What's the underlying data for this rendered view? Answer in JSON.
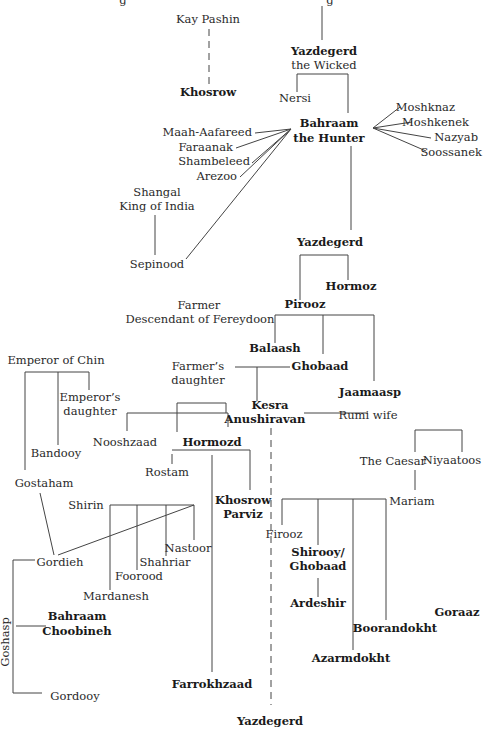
{
  "diagram": {
    "type": "genealogy-tree",
    "nodes": [
      {
        "id": "cut-g1",
        "text": "g",
        "x": 123,
        "y": 4,
        "anchor": "middle",
        "bold": false
      },
      {
        "id": "cut-g2",
        "text": "g",
        "x": 330,
        "y": 4,
        "anchor": "middle",
        "bold": false
      },
      {
        "id": "kay-pashin",
        "text": "Kay Pashin",
        "x": 208,
        "y": 23,
        "anchor": "middle",
        "bold": false
      },
      {
        "id": "khosrow",
        "text": "Khosrow",
        "x": 208,
        "y": 96,
        "anchor": "middle",
        "bold": true
      },
      {
        "id": "yazdegerd-wicked",
        "text": "Yazdegerd",
        "x": 324,
        "y": 55,
        "anchor": "middle",
        "bold": true
      },
      {
        "id": "yazdegerd-wicked-epithet",
        "text": "the Wicked",
        "x": 324,
        "y": 69,
        "anchor": "middle",
        "bold": false
      },
      {
        "id": "nersi",
        "text": "Nersi",
        "x": 295,
        "y": 102,
        "anchor": "middle",
        "bold": false
      },
      {
        "id": "bahraam-hunter",
        "text": "Bahraam",
        "x": 329,
        "y": 127,
        "anchor": "middle",
        "bold": true
      },
      {
        "id": "bahraam-hunter-epithet",
        "text": "the Hunter",
        "x": 329,
        "y": 142,
        "anchor": "middle",
        "bold": true
      },
      {
        "id": "moshknaz",
        "text": "Moshknaz",
        "x": 455,
        "y": 111,
        "anchor": "end",
        "bold": false
      },
      {
        "id": "moshkenek",
        "text": "Moshkenek",
        "x": 469,
        "y": 126,
        "anchor": "end",
        "bold": false
      },
      {
        "id": "nazyab",
        "text": "Nazyab",
        "x": 478,
        "y": 141,
        "anchor": "end",
        "bold": false
      },
      {
        "id": "soossanek",
        "text": "Soossanek",
        "x": 482,
        "y": 156,
        "anchor": "end",
        "bold": false
      },
      {
        "id": "maah-aafareed",
        "text": "Maah-Aafareed",
        "x": 252,
        "y": 136,
        "anchor": "end",
        "bold": false
      },
      {
        "id": "faraanak",
        "text": "Faraanak",
        "x": 233,
        "y": 151,
        "anchor": "end",
        "bold": false
      },
      {
        "id": "shambeleed",
        "text": "Shambeleed",
        "x": 250,
        "y": 165,
        "anchor": "end",
        "bold": false
      },
      {
        "id": "arezoo",
        "text": "Arezoo",
        "x": 237,
        "y": 180,
        "anchor": "end",
        "bold": false
      },
      {
        "id": "shangal",
        "text": "Shangal",
        "x": 157,
        "y": 196,
        "anchor": "middle",
        "bold": false
      },
      {
        "id": "shangal-title",
        "text": "King of India",
        "x": 157,
        "y": 210,
        "anchor": "middle",
        "bold": false
      },
      {
        "id": "sepinood",
        "text": "Sepinood",
        "x": 157,
        "y": 268,
        "anchor": "middle",
        "bold": false
      },
      {
        "id": "yazdegerd-2",
        "text": "Yazdegerd",
        "x": 330,
        "y": 246,
        "anchor": "middle",
        "bold": true
      },
      {
        "id": "hormoz",
        "text": "Hormoz",
        "x": 351,
        "y": 290,
        "anchor": "middle",
        "bold": true
      },
      {
        "id": "pirooz",
        "text": "Pirooz",
        "x": 305,
        "y": 308,
        "anchor": "middle",
        "bold": true
      },
      {
        "id": "farmer",
        "text": "Farmer",
        "x": 199,
        "y": 309,
        "anchor": "middle",
        "bold": false
      },
      {
        "id": "farmer-desc",
        "text": "Descendant of Fereydoon",
        "x": 200,
        "y": 323,
        "anchor": "middle",
        "bold": false
      },
      {
        "id": "balaash",
        "text": "Balaash",
        "x": 275,
        "y": 352,
        "anchor": "middle",
        "bold": true
      },
      {
        "id": "ghobaad",
        "text": "Ghobaad",
        "x": 320,
        "y": 370,
        "anchor": "middle",
        "bold": true
      },
      {
        "id": "farmers-daughter",
        "text": "Farmer’s",
        "x": 198,
        "y": 370,
        "anchor": "middle",
        "bold": false
      },
      {
        "id": "farmers-daughter-2",
        "text": "daughter",
        "x": 198,
        "y": 384,
        "anchor": "middle",
        "bold": false
      },
      {
        "id": "jaamaasp",
        "text": "Jaamaasp",
        "x": 370,
        "y": 396,
        "anchor": "middle",
        "bold": true
      },
      {
        "id": "kesra",
        "text": "Kesra",
        "x": 270,
        "y": 409,
        "anchor": "middle",
        "bold": true
      },
      {
        "id": "kesra-2",
        "text": "Anushiravan",
        "x": 265,
        "y": 423,
        "anchor": "middle",
        "bold": true
      },
      {
        "id": "rumi-wife",
        "text": "Rumi wife",
        "x": 368,
        "y": 419,
        "anchor": "middle",
        "bold": false
      },
      {
        "id": "emperor-chin",
        "text": "Emperor of Chin",
        "x": 56,
        "y": 364,
        "anchor": "middle",
        "bold": false
      },
      {
        "id": "emperors-daughter",
        "text": "Emperor’s",
        "x": 90,
        "y": 401,
        "anchor": "middle",
        "bold": false
      },
      {
        "id": "emperors-daughter-2",
        "text": "daughter",
        "x": 90,
        "y": 415,
        "anchor": "middle",
        "bold": false
      },
      {
        "id": "nooshzaad",
        "text": "Nooshzaad",
        "x": 125,
        "y": 446,
        "anchor": "middle",
        "bold": false
      },
      {
        "id": "hormozd",
        "text": "Hormozd",
        "x": 212,
        "y": 446,
        "anchor": "middle",
        "bold": true
      },
      {
        "id": "bandooy",
        "text": "Bandooy",
        "x": 56,
        "y": 457,
        "anchor": "middle",
        "bold": false
      },
      {
        "id": "rostam",
        "text": "Rostam",
        "x": 167,
        "y": 476,
        "anchor": "middle",
        "bold": false
      },
      {
        "id": "gostaham",
        "text": "Gostaham",
        "x": 44,
        "y": 487,
        "anchor": "middle",
        "bold": false
      },
      {
        "id": "khosrow-parviz",
        "text": "Khosrow",
        "x": 243,
        "y": 504,
        "anchor": "middle",
        "bold": true
      },
      {
        "id": "khosrow-parviz-2",
        "text": "Parviz",
        "x": 243,
        "y": 518,
        "anchor": "middle",
        "bold": true
      },
      {
        "id": "shirin",
        "text": "Shirin",
        "x": 86,
        "y": 509,
        "anchor": "middle",
        "bold": false
      },
      {
        "id": "the-caesar",
        "text": "The Caesar",
        "x": 393,
        "y": 465,
        "anchor": "middle",
        "bold": false
      },
      {
        "id": "niyaatoos",
        "text": "Niyaatoos",
        "x": 452,
        "y": 464,
        "anchor": "middle",
        "bold": false
      },
      {
        "id": "mariam",
        "text": "Mariam",
        "x": 412,
        "y": 505,
        "anchor": "middle",
        "bold": false
      },
      {
        "id": "nastoor",
        "text": "Nastoor",
        "x": 188,
        "y": 552,
        "anchor": "middle",
        "bold": false
      },
      {
        "id": "shahriar",
        "text": "Shahriar",
        "x": 165,
        "y": 566,
        "anchor": "middle",
        "bold": false
      },
      {
        "id": "gordieh",
        "text": "Gordieh",
        "x": 60,
        "y": 566,
        "anchor": "middle",
        "bold": false
      },
      {
        "id": "foorood",
        "text": "Foorood",
        "x": 139,
        "y": 580,
        "anchor": "middle",
        "bold": false
      },
      {
        "id": "mardanesh",
        "text": "Mardanesh",
        "x": 116,
        "y": 600,
        "anchor": "middle",
        "bold": false
      },
      {
        "id": "firooz",
        "text": "Firooz",
        "x": 284,
        "y": 538,
        "anchor": "middle",
        "bold": false
      },
      {
        "id": "shirooy",
        "text": "Shirooy/",
        "x": 318,
        "y": 556,
        "anchor": "middle",
        "bold": true
      },
      {
        "id": "shirooy-2",
        "text": "Ghobaad",
        "x": 318,
        "y": 570,
        "anchor": "middle",
        "bold": true
      },
      {
        "id": "ardeshir",
        "text": "Ardeshir",
        "x": 318,
        "y": 607,
        "anchor": "middle",
        "bold": true
      },
      {
        "id": "goraaz",
        "text": "Goraaz",
        "x": 457,
        "y": 616,
        "anchor": "middle",
        "bold": true
      },
      {
        "id": "boorandokht",
        "text": "Boorandokht",
        "x": 395,
        "y": 632,
        "anchor": "middle",
        "bold": true
      },
      {
        "id": "azarmdokht",
        "text": "Azarmdokht",
        "x": 351,
        "y": 662,
        "anchor": "middle",
        "bold": true
      },
      {
        "id": "bahraam-choobineh",
        "text": "Bahraam",
        "x": 77,
        "y": 620,
        "anchor": "middle",
        "bold": true
      },
      {
        "id": "bahraam-choobineh-2",
        "text": "Choobineh",
        "x": 77,
        "y": 635,
        "anchor": "middle",
        "bold": true
      },
      {
        "id": "gordooy",
        "text": "Gordooy",
        "x": 75,
        "y": 700,
        "anchor": "middle",
        "bold": false
      },
      {
        "id": "farrokhzaad",
        "text": "Farrokhzaad",
        "x": 212,
        "y": 688,
        "anchor": "middle",
        "bold": true
      },
      {
        "id": "yazdegerd-3",
        "text": "Yazdegerd",
        "x": 270,
        "y": 725,
        "anchor": "middle",
        "bold": true
      }
    ],
    "rotated_labels": [
      {
        "id": "goshasp",
        "text": "Goshasp",
        "x": 6,
        "y": 642,
        "rotate": -90,
        "anchor": "middle",
        "bold": false
      }
    ],
    "lines": [
      {
        "points": "322,6 322,40"
      },
      {
        "points": "209,29 209,88",
        "dash": true
      },
      {
        "points": "297,92 297,74 348,74 348,113"
      },
      {
        "points": "351,146 351,230"
      },
      {
        "points": "373,128 400,107"
      },
      {
        "points": "373,128 412,122"
      },
      {
        "points": "373,128 431,138"
      },
      {
        "points": "373,128 426,151"
      },
      {
        "points": "291,129 255,133"
      },
      {
        "points": "291,129 236,148"
      },
      {
        "points": "291,129 252,163"
      },
      {
        "points": "291,129 240,177"
      },
      {
        "points": "291,129 186,259"
      },
      {
        "points": "155,215 155,255"
      },
      {
        "points": "300,300 300,255 348,255 348,280"
      },
      {
        "points": "275,343 275,315 374,315 374,381"
      },
      {
        "points": "323,315 323,354"
      },
      {
        "points": "235,367 290,367"
      },
      {
        "points": "257,367 257,401"
      },
      {
        "points": "226,413 226,403 177,403 177,432 ..."
      },
      {
        "points": "127,431 127,413 228,413 228,427"
      },
      {
        "points": "304,413 368,413"
      },
      {
        "points": "271,428 271,705",
        "dash": true
      },
      {
        "points": "172,454 172,464"
      },
      {
        "points": "172,450 250,450 250,490"
      },
      {
        "points": "212,455 212,672"
      },
      {
        "points": "25,372 25,470"
      },
      {
        "points": "25,372 89,372 89,390"
      },
      {
        "points": "58,372 58,445"
      },
      {
        "points": "40,493 54,555"
      },
      {
        "points": "110,505 194,505 194,540"
      },
      {
        "points": "110,505 110,590"
      },
      {
        "points": "137,505 137,570"
      },
      {
        "points": "166,505 166,556"
      },
      {
        "points": "58,555 194,505"
      },
      {
        "points": "13,560 35,560"
      },
      {
        "points": "13,560 13,693 42,693"
      },
      {
        "points": "16,626 46,626"
      },
      {
        "points": "282,499 282,525"
      },
      {
        "points": "282,499 386,499"
      },
      {
        "points": "318,499 318,545"
      },
      {
        "points": "353,499 353,650"
      },
      {
        "points": "386,499 386,620"
      },
      {
        "points": "318,578 318,597"
      },
      {
        "points": "415,490 415,470"
      },
      {
        "points": "415,430 462,430 462,452"
      },
      {
        "points": "415,430 415,452"
      }
    ]
  }
}
